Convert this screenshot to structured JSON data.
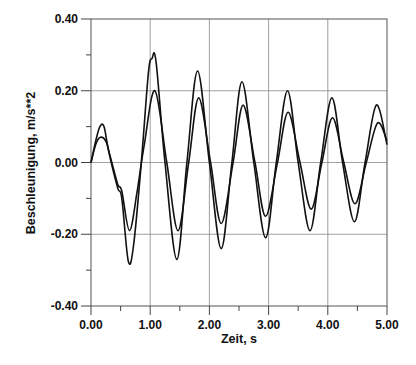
{
  "chart_data": {
    "type": "line",
    "title": "",
    "xlabel": "Zeit, s",
    "ylabel": "Beschleunigung, m/s**2",
    "xlim": [
      0,
      5
    ],
    "ylim": [
      -0.4,
      0.4
    ],
    "grid": true,
    "legend": null,
    "x_ticks": [
      "0.00",
      "1.00",
      "2.00",
      "3.00",
      "4.00",
      "5.00"
    ],
    "y_ticks": [
      "0.40",
      "0.20",
      "0.00",
      "-0.20",
      "-0.40"
    ],
    "series": [
      {
        "name": "outer",
        "x": [
          0.0,
          0.08,
          0.15,
          0.22,
          0.3,
          0.45,
          0.52,
          0.63,
          0.72,
          0.85,
          0.97,
          1.03,
          1.1,
          1.25,
          1.45,
          1.62,
          1.8,
          2.0,
          2.2,
          2.38,
          2.55,
          2.75,
          2.95,
          3.13,
          3.32,
          3.5,
          3.7,
          3.88,
          4.07,
          4.25,
          4.45,
          4.63,
          4.82,
          5.0
        ],
        "y": [
          0.0,
          0.06,
          0.1,
          0.1,
          0.03,
          -0.07,
          -0.1,
          -0.275,
          -0.23,
          0.0,
          0.25,
          0.29,
          0.28,
          0.0,
          -0.27,
          0.0,
          0.255,
          0.0,
          -0.24,
          0.0,
          0.225,
          0.0,
          -0.21,
          0.0,
          0.2,
          0.0,
          -0.19,
          0.0,
          0.18,
          0.0,
          -0.165,
          0.0,
          0.16,
          0.05
        ]
      },
      {
        "name": "inner",
        "x": [
          0.0,
          0.08,
          0.15,
          0.25,
          0.32,
          0.45,
          0.52,
          0.65,
          0.78,
          0.9,
          1.08,
          1.28,
          1.47,
          1.65,
          1.82,
          2.02,
          2.2,
          2.4,
          2.57,
          2.77,
          2.95,
          3.15,
          3.33,
          3.53,
          3.72,
          3.9,
          4.08,
          4.27,
          4.46,
          4.65,
          4.84,
          5.0
        ],
        "y": [
          0.0,
          0.05,
          0.07,
          0.06,
          0.02,
          -0.06,
          -0.08,
          -0.19,
          -0.08,
          0.05,
          0.2,
          0.0,
          -0.19,
          0.0,
          0.18,
          0.0,
          -0.17,
          0.0,
          0.16,
          0.0,
          -0.15,
          0.0,
          0.14,
          0.0,
          -0.13,
          0.0,
          0.125,
          0.0,
          -0.115,
          0.0,
          0.11,
          0.06
        ]
      }
    ]
  }
}
